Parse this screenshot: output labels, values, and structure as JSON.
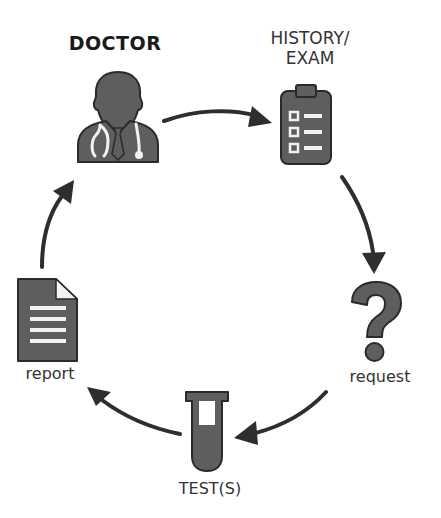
{
  "diagram": {
    "type": "cycle",
    "nodes": [
      {
        "id": "doctor",
        "label": "DOCTOR",
        "icon": "doctor-icon"
      },
      {
        "id": "history_exam",
        "label_line1": "HISTORY/",
        "label_line2": "EXAM",
        "icon": "clipboard-icon"
      },
      {
        "id": "request",
        "label": "request",
        "icon": "question-mark-icon"
      },
      {
        "id": "tests",
        "label": "TEST(S)",
        "icon": "test-tube-icon"
      },
      {
        "id": "report",
        "label": "report",
        "icon": "document-icon"
      }
    ],
    "edges": [
      {
        "from": "doctor",
        "to": "history_exam"
      },
      {
        "from": "history_exam",
        "to": "request"
      },
      {
        "from": "request",
        "to": "tests"
      },
      {
        "from": "tests",
        "to": "report"
      },
      {
        "from": "report",
        "to": "doctor"
      }
    ],
    "colors": {
      "icon_fill": "#5e5e5e",
      "icon_stroke": "#2a2a2a",
      "arrow": "#2e2e2e",
      "text": "#333333",
      "background": "#ffffff"
    }
  }
}
